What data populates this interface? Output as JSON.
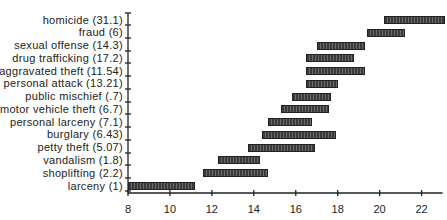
{
  "chart_data": {
    "type": "bar",
    "subtype": "floating-range-horizontal",
    "title": "",
    "xlabel": "",
    "ylabel": "",
    "xlim": [
      8,
      23
    ],
    "xticks": [
      8,
      10,
      12,
      14,
      16,
      18,
      20,
      22
    ],
    "grid": false,
    "legend": null,
    "categories": [
      "homicide (31.1)",
      "fraud (6)",
      "sexual offense (14.3)",
      "drug trafficking (17.2)",
      "aggravated theft (11.54)",
      "personal attack (13.21)",
      "public mischief (.7)",
      "motor vehicle theft (6.7)",
      "personal larceny (7.1)",
      "burglary (6.43)",
      "petty theft (5.07)",
      "vandalism (1.8)",
      "shoplifting (2.2)",
      "larceny (1)"
    ],
    "series": [
      {
        "name": "range",
        "values": [
          [
            20.2,
            23.0
          ],
          [
            19.4,
            21.1
          ],
          [
            17.0,
            19.2
          ],
          [
            16.5,
            18.7
          ],
          [
            16.5,
            19.2
          ],
          [
            16.5,
            17.9
          ],
          [
            15.8,
            17.6
          ],
          [
            15.3,
            17.5
          ],
          [
            14.7,
            16.7
          ],
          [
            14.4,
            17.8
          ],
          [
            13.7,
            16.8
          ],
          [
            12.3,
            14.2
          ],
          [
            11.6,
            14.6
          ],
          [
            8.0,
            11.1
          ]
        ]
      }
    ],
    "colors": {
      "bar": "#3a3a3a",
      "axis": "#222222"
    }
  }
}
